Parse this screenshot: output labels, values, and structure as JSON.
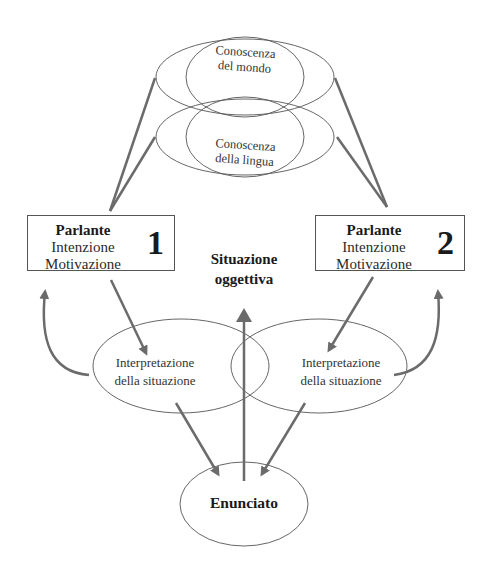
{
  "diagram": {
    "knowledge": {
      "world": {
        "line1": "Conoscenza",
        "line2": "del mondo"
      },
      "language": {
        "line1": "Conoscenza",
        "line2": "della lingua"
      }
    },
    "speaker1": {
      "title": "Parlante",
      "line1": "Intenzione",
      "line2": "Motivazione",
      "number": "1"
    },
    "speaker2": {
      "title": "Parlante",
      "line1": "Intenzione",
      "line2": "Motivazione",
      "number": "2"
    },
    "objective_situation": {
      "line1": "Situazione",
      "line2": "oggettiva"
    },
    "interpretation_left": {
      "line1": "Interpretazione",
      "line2": "della situazione"
    },
    "interpretation_right": {
      "line1": "Interpretazione",
      "line2": "della situazione"
    },
    "utterance": {
      "label": "Enunciato"
    },
    "colors": {
      "stroke": "#555555",
      "arrow": "#6b6b6b",
      "text": "#2a2a2a"
    }
  }
}
